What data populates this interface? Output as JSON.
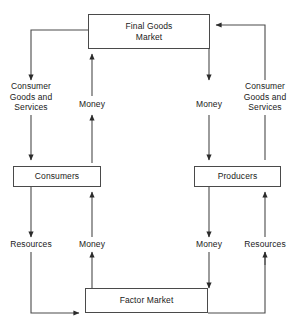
{
  "diagram": {
    "type": "flowchart",
    "background_color": "#ffffff",
    "line_color": "#4a4a4a",
    "text_color": "#1a1a1a",
    "nodes": [
      {
        "id": "final-goods-market",
        "label": "Final Goods\nMarket",
        "x": 88,
        "y": 14,
        "w": 122,
        "h": 35
      },
      {
        "id": "consumers",
        "label": "Consumers",
        "x": 13,
        "y": 166,
        "w": 88,
        "h": 21
      },
      {
        "id": "producers",
        "label": "Producers",
        "x": 194,
        "y": 166,
        "w": 87,
        "h": 21
      },
      {
        "id": "factor-market",
        "label": "Factor Market",
        "x": 85,
        "y": 288,
        "w": 123,
        "h": 25
      }
    ],
    "edge_labels": [
      {
        "id": "consumer-goods-left",
        "label": "Consumer\nGoods and\nServices",
        "cx": 31,
        "cy": 87
      },
      {
        "id": "money-upper-left",
        "label": "Money",
        "cx": 92,
        "cy": 105
      },
      {
        "id": "money-upper-right",
        "label": "Money",
        "cx": 209,
        "cy": 105
      },
      {
        "id": "consumer-goods-right",
        "label": "Consumer\nGoods and\nServices",
        "cx": 265,
        "cy": 87
      },
      {
        "id": "resources-left",
        "label": "Resources",
        "cx": 31,
        "cy": 244
      },
      {
        "id": "money-lower-left",
        "label": "Money",
        "cx": 92,
        "cy": 244
      },
      {
        "id": "money-lower-right",
        "label": "Money",
        "cx": 209,
        "cy": 244
      },
      {
        "id": "resources-right",
        "label": "Resources",
        "cx": 265,
        "cy": 244
      }
    ],
    "flows": [
      {
        "id": "flow-goods-to-consumers",
        "from": "final-goods-market",
        "to": "consumers",
        "label": "Consumer Goods and Services",
        "direction": "down-left"
      },
      {
        "id": "flow-money-consumers-to-goods",
        "from": "consumers",
        "to": "final-goods-market",
        "label": "Money",
        "direction": "up"
      },
      {
        "id": "flow-money-goods-to-producers",
        "from": "final-goods-market",
        "to": "producers",
        "label": "Money",
        "direction": "down"
      },
      {
        "id": "flow-goods-producers-to-market",
        "from": "producers",
        "to": "final-goods-market",
        "label": "Consumer Goods and Services",
        "direction": "up-right"
      },
      {
        "id": "flow-resources-consumers-to-factor",
        "from": "consumers",
        "to": "factor-market",
        "label": "Resources",
        "direction": "down-left"
      },
      {
        "id": "flow-money-factor-to-consumers",
        "from": "factor-market",
        "to": "consumers",
        "label": "Money",
        "direction": "up"
      },
      {
        "id": "flow-money-producers-to-factor",
        "from": "producers",
        "to": "factor-market",
        "label": "Money",
        "direction": "down"
      },
      {
        "id": "flow-resources-factor-to-producers",
        "from": "factor-market",
        "to": "producers",
        "label": "Resources",
        "direction": "up-right"
      }
    ]
  }
}
